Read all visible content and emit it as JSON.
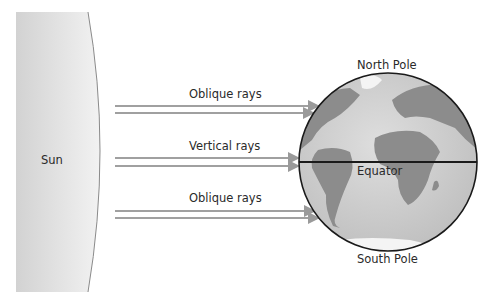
{
  "diagram": {
    "sun_label": "Sun",
    "rays": [
      {
        "label": "Oblique rays"
      },
      {
        "label": "Vertical rays"
      },
      {
        "label": "Oblique rays"
      }
    ],
    "globe": {
      "north_label": "North Pole",
      "equator_label": "Equator",
      "south_label": "South Pole"
    },
    "colors": {
      "sun_fill": "#dcdcdc",
      "ray": "#a0a0a0",
      "ocean": "#c8c8c8",
      "land": "#8a8a8a",
      "outline": "#1a1a1a"
    }
  }
}
